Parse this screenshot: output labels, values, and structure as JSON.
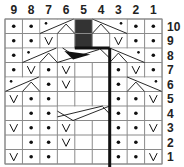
{
  "chart": {
    "columns": [
      "9",
      "8",
      "7",
      "6",
      "5",
      "4",
      "3",
      "2",
      "1"
    ],
    "rows": [
      "10",
      "9",
      "8",
      "7",
      "6",
      "5",
      "4",
      "3",
      "2",
      "1"
    ],
    "colors": {
      "grid": "#8a8a8a",
      "ink": "#111111",
      "shade": "#333333",
      "background": "#ffffff"
    },
    "cells": {
      "10": [
        "dot",
        "dot",
        "cableL",
        "cableL",
        "dark",
        "cableR",
        "cableR",
        "dot",
        "dot"
      ],
      "9": [
        "dot",
        "dot",
        "slip",
        "blank",
        "dark",
        "blank",
        "slip",
        "dot",
        "dot"
      ],
      "8": [
        "dot",
        "cableL",
        "cableL",
        "wedge",
        "wedge",
        "wedge",
        "cableR",
        "cableR",
        "dot"
      ],
      "7": [
        "dot",
        "slip",
        "dot",
        "slip",
        "blank",
        "blank",
        "dot",
        "slip",
        "dot"
      ],
      "6": [
        "cableL",
        "cableL",
        "dot",
        "slip",
        "blank",
        "blank",
        "dot",
        "cableR",
        "cableR"
      ],
      "5": [
        "slip",
        "dot",
        "dot",
        "blank",
        "blank",
        "blank",
        "dot",
        "dot",
        "slip"
      ],
      "4": [
        "blank",
        "dot",
        "dot",
        "cross3",
        "cross3",
        "cross3",
        "dot",
        "dot",
        "blank"
      ],
      "3": [
        "slip",
        "dot",
        "dot",
        "slip",
        "blank",
        "blank",
        "dot",
        "dot",
        "slip"
      ],
      "2": [
        "blank",
        "dot",
        "dot",
        "slip",
        "blank",
        "blank",
        "dot",
        "dot",
        "blank"
      ],
      "1": [
        "slip",
        "dot",
        "dot",
        "blank",
        "blank",
        "blank",
        "dot",
        "dot",
        "slip"
      ]
    },
    "legend_symbols": {
      "dot": "purl",
      "slip": "slip stitch (V)",
      "blank": "knit",
      "dark": "no stitch",
      "cableL": "2-st left cross with purl",
      "cableR": "2-st right cross with purl",
      "cross3": "3-st cable cross",
      "wedge": "3-st cable with decrease"
    }
  }
}
